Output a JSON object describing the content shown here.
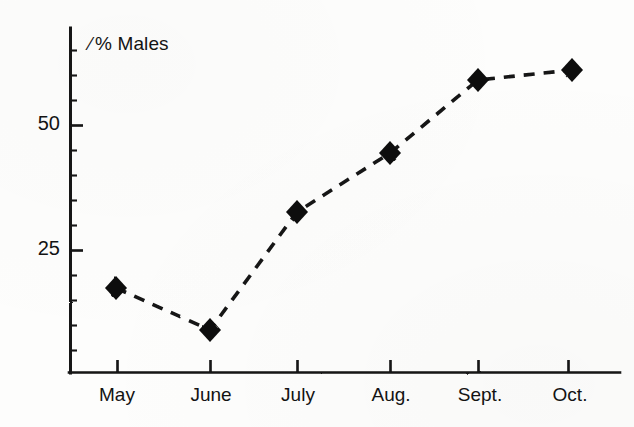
{
  "chart_data": {
    "type": "line",
    "title": "",
    "ylabel": "% Males",
    "xlabel": "",
    "categories": [
      "May",
      "June",
      "July",
      "Aug.",
      "Sept.",
      "Oct."
    ],
    "values": [
      17.4,
      9.0,
      32.6,
      44.4,
      59.0,
      61.0
    ],
    "ylim": [
      0,
      68
    ],
    "yticks_major": [
      25,
      50
    ],
    "ytick_labels": [
      "25",
      "50"
    ],
    "yticks_minor": [
      5,
      10,
      15,
      20,
      30,
      35,
      40,
      45,
      55,
      60,
      65
    ],
    "grid": false,
    "legend": null,
    "marker": "diamond",
    "line_style": "dashed",
    "series": [
      {
        "name": "% Males",
        "values": [
          17.4,
          9.0,
          32.6,
          44.4,
          59.0,
          61.0
        ]
      }
    ]
  },
  "axes": {
    "y_axis_title": "% Males",
    "percent_symbol": "⁄",
    "y_labels": [
      {
        "text": "50",
        "value": 50
      },
      {
        "text": "25",
        "value": 25
      }
    ],
    "x_labels": [
      {
        "text": "May",
        "index": 0
      },
      {
        "text": "June",
        "index": 1
      },
      {
        "text": "July",
        "index": 2
      },
      {
        "text": "Aug.",
        "index": 3
      },
      {
        "text": "Sept.",
        "index": 4
      },
      {
        "text": "Oct.",
        "index": 5
      }
    ]
  },
  "colors": {
    "ink": "#131313",
    "paper": "#fdfdfc"
  }
}
